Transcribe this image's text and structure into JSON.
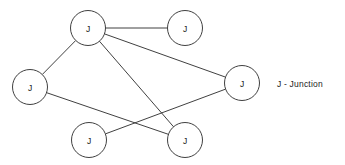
{
  "diagram": {
    "background_color": "#ffffff",
    "stroke_color": "#2a2a2a",
    "node_fill_color": "#ffffff",
    "node_radius": 17.5,
    "nodes": [
      {
        "id": "n1",
        "label": "J",
        "name": "junction-node-top-left",
        "cx": 88,
        "cy": 28
      },
      {
        "id": "n2",
        "label": "J",
        "name": "junction-node-top-right",
        "cx": 185,
        "cy": 28
      },
      {
        "id": "n3",
        "label": "J",
        "name": "junction-node-left",
        "cx": 30,
        "cy": 87
      },
      {
        "id": "n4",
        "label": "J",
        "name": "junction-node-right",
        "cx": 242,
        "cy": 83
      },
      {
        "id": "n5",
        "label": "J",
        "name": "junction-node-bottom-left",
        "cx": 89,
        "cy": 140
      },
      {
        "id": "n6",
        "label": "J",
        "name": "junction-node-bottom-right",
        "cx": 185,
        "cy": 140
      }
    ],
    "edges": [
      {
        "from": "n1",
        "to": "n2",
        "name": "edge-top-left-to-top-right"
      },
      {
        "from": "n1",
        "to": "n3",
        "name": "edge-top-left-to-left"
      },
      {
        "from": "n1",
        "to": "n4",
        "name": "edge-top-left-to-right"
      },
      {
        "from": "n1",
        "to": "n6",
        "name": "edge-top-left-to-bottom-right"
      },
      {
        "from": "n3",
        "to": "n6",
        "name": "edge-left-to-bottom-right"
      },
      {
        "from": "n5",
        "to": "n4",
        "name": "edge-bottom-left-to-right"
      }
    ],
    "legend": {
      "text": "J - Junction",
      "x": 277,
      "y": 79
    }
  }
}
